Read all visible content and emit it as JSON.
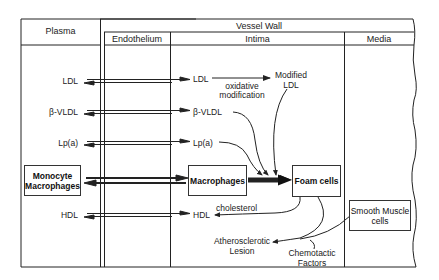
{
  "headers": {
    "plasma": "Plasma",
    "vessel_wall": "Vessel Wall",
    "endothelium": "Endothelium",
    "intima": "Intima",
    "media": "Media"
  },
  "plasma_labels": {
    "ldl": "LDL",
    "bvldl": "β-VLDL",
    "lpa": "Lp(a)",
    "hdl": "HDL"
  },
  "boxes": {
    "monocyte": [
      "Monocyte",
      "Macrophages"
    ],
    "macrophages": "Macrophages",
    "foam_cells": "Foam cells",
    "smooth_muscle": [
      "Smooth Muscle",
      "cells"
    ]
  },
  "intima_labels": {
    "ldl": "LDL",
    "bvldl": "β-VLDL",
    "lpa": "Lp(a)",
    "hdl": "HDL",
    "oxidative": [
      "oxidative",
      "modification"
    ],
    "modified_ldl": [
      "Modified",
      "LDL"
    ],
    "cholesterol": "cholesterol",
    "lesion": [
      "Atherosclerotic",
      "Lesion"
    ],
    "chemotactic": [
      "Chemotactic",
      "Factors"
    ]
  },
  "colors": {
    "line": "#222222",
    "background": "#ffffff"
  }
}
